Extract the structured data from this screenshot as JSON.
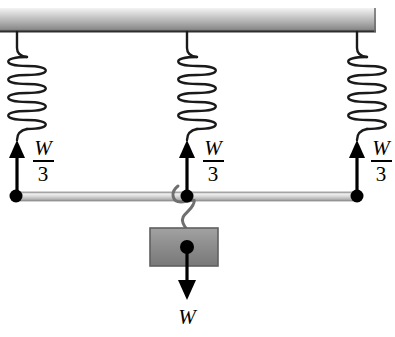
{
  "diagram": {
    "background_color": "#ffffff",
    "ceiling": {
      "name": "ceiling-bar",
      "x": 0,
      "y": 8,
      "width": 376,
      "height": 24,
      "gradient_top": "#f2f2f2",
      "gradient_mid": "#b8b8b8",
      "gradient_bottom": "#6e6e6e",
      "edge_color": "#3a3a3a"
    },
    "springs": [
      {
        "id": "left",
        "name": "spring-left",
        "anchor_x": 17,
        "top_y": 32,
        "coil_top": 55,
        "coil_bottom": 126,
        "bottom_y": 143,
        "coil_count": 8,
        "coil_rx": 17,
        "stroke": "#1a1a1a"
      },
      {
        "id": "middle",
        "name": "spring-middle",
        "anchor_x": 187,
        "top_y": 32,
        "coil_top": 55,
        "coil_bottom": 126,
        "bottom_y": 143,
        "coil_count": 8,
        "coil_rx": 17,
        "stroke": "#1a1a1a"
      },
      {
        "id": "right",
        "name": "spring-right",
        "anchor_x": 357,
        "top_y": 32,
        "coil_top": 55,
        "coil_bottom": 126,
        "bottom_y": 143,
        "coil_count": 8,
        "coil_rx": 17,
        "stroke": "#1a1a1a"
      }
    ],
    "tension_arrows": [
      {
        "id": "left",
        "name": "tension-arrow-left",
        "x": 17,
        "tail_y": 196,
        "head_y": 142,
        "label_x": 43,
        "label_y": 152,
        "color": "#000000"
      },
      {
        "id": "middle",
        "name": "tension-arrow-middle",
        "x": 187,
        "tail_y": 196,
        "head_y": 142,
        "label_x": 213,
        "label_y": 152,
        "color": "#000000"
      },
      {
        "id": "right",
        "name": "tension-arrow-right",
        "x": 357,
        "tail_y": 196,
        "head_y": 142,
        "label_x": 379,
        "label_y": 152,
        "color": "#000000"
      }
    ],
    "force_labels": {
      "numerator": "W",
      "denominator": "3",
      "fraction_bar": true,
      "values": [
        "W/3",
        "W/3",
        "W/3"
      ]
    },
    "rod": {
      "name": "horizontal-rod",
      "x1": 14,
      "x2": 358,
      "y": 196,
      "thickness": 8,
      "fill_light": "#e8e8e8",
      "fill_mid": "#c9c9c9",
      "edge_color": "#8a8a8a"
    },
    "joint_dots": [
      {
        "name": "joint-dot-left",
        "cx": 16,
        "cy": 196,
        "r": 6
      },
      {
        "name": "joint-dot-middle",
        "cx": 187,
        "cy": 196,
        "r": 6
      },
      {
        "name": "joint-dot-right",
        "cx": 357,
        "cy": 196,
        "r": 6
      }
    ],
    "hook": {
      "name": "s-hook",
      "top_y": 186,
      "bottom_y": 230,
      "center_x": 187,
      "stroke": "#6f6f6f",
      "stroke_width": 3
    },
    "block": {
      "name": "hanging-block",
      "x": 150,
      "y": 228,
      "width": 68,
      "height": 38,
      "fill_light": "#9a9a9a",
      "fill_dark": "#7c7c7c",
      "border_color": "#5f5f5f"
    },
    "weight_arrow": {
      "name": "weight-arrow",
      "x": 187,
      "tail_y": 247,
      "head_y": 297,
      "color": "#000000",
      "origin_dot_r": 7
    },
    "weight_label": {
      "name": "weight-label",
      "text": "W",
      "x": 187,
      "y": 320
    }
  }
}
